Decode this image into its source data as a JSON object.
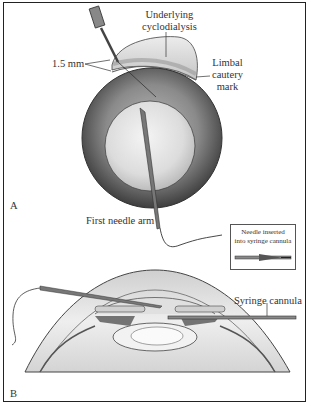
{
  "figure": {
    "panel_a": {
      "letter": "A",
      "labels": {
        "underlying_cyclodialysis_line1": "Underlying",
        "underlying_cyclodialysis_line2": "cyclodialysis",
        "measurement": "1.5 mm",
        "limbal_line1": "Limbal",
        "limbal_line2": "cautery",
        "limbal_line3": "mark",
        "first_needle_arm": "First needle arm"
      },
      "inset": {
        "line1": "Needle inserted",
        "line2": "into syringe cannula"
      }
    },
    "panel_b": {
      "letter": "B",
      "labels": {
        "syringe_cannula": "Syringe cannula"
      }
    },
    "colors": {
      "frame": "#222222",
      "outline": "#333333",
      "eye_dark": "#5a5a5a",
      "eye_light": "#e6e6e6",
      "cyclodialysis": "#c8c8c8"
    }
  }
}
